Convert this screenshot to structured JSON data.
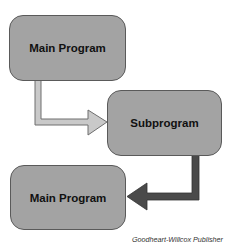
{
  "diagram": {
    "nodes": [
      {
        "id": "main1",
        "label": "Main Program"
      },
      {
        "id": "sub",
        "label": "Subprogram"
      },
      {
        "id": "main2",
        "label": "Main Program"
      }
    ],
    "edges": [
      {
        "from": "main1",
        "to": "sub",
        "style": "light",
        "color": "#c8c8c8"
      },
      {
        "from": "sub",
        "to": "main2",
        "style": "dark",
        "color": "#4a4a4a"
      }
    ],
    "caption": "Goodheart-Willcox Publisher"
  }
}
